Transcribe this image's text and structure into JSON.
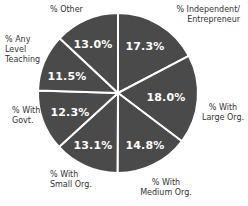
{
  "chart_data": {
    "type": "pie",
    "title": "",
    "categories": [
      "% Independent/ Entrepreneur",
      "% With Large Org.",
      "% With Medium Org.",
      "% With Small Org.",
      "% With Govt.",
      "% Any Level Teaching",
      "% Other"
    ],
    "values": [
      17.3,
      18.0,
      14.8,
      13.1,
      12.3,
      11.5,
      13.0
    ],
    "value_labels": [
      "17.3%",
      "18.0%",
      "14.8%",
      "13.1%",
      "12.3%",
      "11.5%",
      "13.0%"
    ],
    "start_angle": "12 o'clock",
    "direction": "clockwise",
    "slice_color": "#4a4a4a",
    "separator_color": "#ffffff",
    "label_color": "#ffffff",
    "legend": "none; category labels placed outside slices"
  },
  "labels": {
    "independent": "% Independent/\nEntrepreneur",
    "large": "% With\nLarge Org.",
    "medium": "% With\nMedium Org.",
    "small": "% With\nSmall Org.",
    "govt": "% With\nGovt.",
    "teaching": "% Any\nLevel\nTeaching",
    "other": "% Other"
  },
  "values": {
    "independent": "17.3%",
    "large": "18.0%",
    "medium": "14.8%",
    "small": "13.1%",
    "govt": "12.3%",
    "teaching": "11.5%",
    "other": "13.0%"
  }
}
